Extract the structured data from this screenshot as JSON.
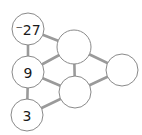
{
  "diagram": {
    "type": "number-puzzle-graph",
    "nodes": [
      {
        "id": "n1",
        "label": "⁻27",
        "cx": 28,
        "cy": 29,
        "r": 16
      },
      {
        "id": "n2",
        "label": "9",
        "cx": 28,
        "cy": 72,
        "r": 16
      },
      {
        "id": "n3",
        "label": "3",
        "cx": 27,
        "cy": 115,
        "r": 16
      },
      {
        "id": "n4",
        "label": "",
        "cx": 74,
        "cy": 47,
        "r": 17
      },
      {
        "id": "n5",
        "label": "",
        "cx": 75,
        "cy": 92,
        "r": 16
      },
      {
        "id": "n6",
        "label": "",
        "cx": 122,
        "cy": 70,
        "r": 16
      }
    ],
    "edges": [
      [
        "n1",
        "n2"
      ],
      [
        "n2",
        "n3"
      ],
      [
        "n1",
        "n4"
      ],
      [
        "n2",
        "n4"
      ],
      [
        "n2",
        "n5"
      ],
      [
        "n3",
        "n5"
      ],
      [
        "n4",
        "n5"
      ],
      [
        "n4",
        "n6"
      ],
      [
        "n5",
        "n6"
      ]
    ],
    "colors": {
      "edge": "#9a9a9a",
      "node_stroke": "#8a8a8a",
      "node_fill": "#ffffff",
      "text": "#1a1a1a"
    }
  }
}
